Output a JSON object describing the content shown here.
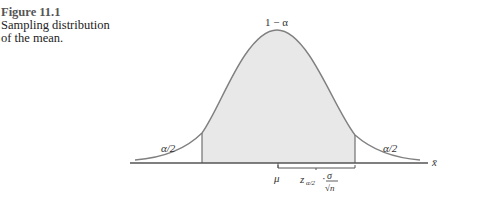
{
  "caption": {
    "figure_number": "Figure 11.1",
    "text_line1": "Sampling distribution",
    "text_line2": "of the mean."
  },
  "diagram": {
    "center_label": "1 − α",
    "left_tail_label": "α/2",
    "right_tail_label": "α/2",
    "mean_label": "μ",
    "axis_label": "x̄",
    "margin_label": "z",
    "margin_subscript": "α/2",
    "margin_dot": "·",
    "sigma": "σ",
    "sqrt_n": "√n",
    "colors": {
      "fill": "#e8e8e8",
      "curve": "#808080",
      "axis": "#555555"
    }
  }
}
